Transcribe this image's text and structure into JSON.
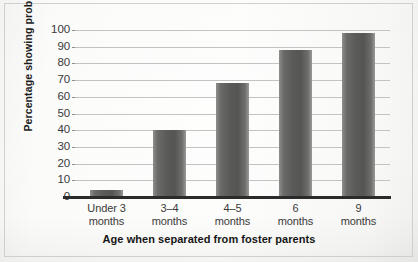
{
  "chart_data": {
    "type": "bar",
    "title": "",
    "xlabel": "Age when separated from foster parents",
    "ylabel": "Percentage showing problems",
    "categories": [
      "Under 3 months",
      "3–4 months",
      "4–5 months",
      "6 months",
      "9 months"
    ],
    "category_lines": [
      {
        "line1": "Under 3",
        "line2": "months"
      },
      {
        "line1": "3–4",
        "line2": "months"
      },
      {
        "line1": "4–5",
        "line2": "months"
      },
      {
        "line1": "6",
        "line2": "months"
      },
      {
        "line1": "9",
        "line2": "months"
      }
    ],
    "values": [
      4,
      40,
      68,
      88,
      98
    ],
    "ylim": [
      0,
      100
    ],
    "ytick_labels": [
      "100",
      "90",
      "80",
      "70",
      "60",
      "50",
      "40",
      "30",
      "20",
      "10",
      "0"
    ],
    "ytick_values": [
      100,
      90,
      80,
      70,
      60,
      50,
      40,
      30,
      20,
      10,
      0
    ],
    "grid": true,
    "legend": null,
    "colors": {
      "bar_dark": "#555553",
      "bar_light": "#9a9a98",
      "gridline": "#c3c3c1",
      "axis": "#2b2b2b",
      "text": "#3b3b3a",
      "paper": "#fafaf8"
    }
  }
}
